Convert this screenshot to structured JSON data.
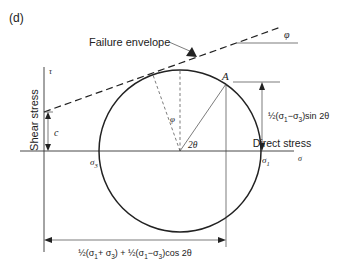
{
  "figure": {
    "panel_label": "(d)",
    "failure_envelope_label": "Failure envelope",
    "phi_label": "φ",
    "point_label": "A",
    "y_axis_label": "Shear stress",
    "y_axis_symbol": "τ",
    "x_axis_label": "Direct stress",
    "x_axis_symbol": "σ",
    "cohesion_label": "c",
    "sigma3": {
      "base": "σ",
      "sub": "3"
    },
    "sigma1": {
      "base": "σ",
      "sub": "1"
    },
    "angle_phi_label": "φ",
    "angle_2theta_label": "2θ",
    "shear_formula": {
      "pre": "½(σ",
      "s1": "1",
      "mid": "−σ",
      "s3": "3",
      "post": ")sin 2θ"
    },
    "normal_formula": {
      "p1": "½(σ",
      "s1": "1",
      "p2": "+ σ",
      "s2": "3",
      "p3": ") + ½(σ",
      "s3": "1",
      "p4": "−σ",
      "s4": "3",
      "p5": ")cos 2θ"
    }
  },
  "colors": {
    "line": "#222222",
    "background": "#ffffff"
  }
}
